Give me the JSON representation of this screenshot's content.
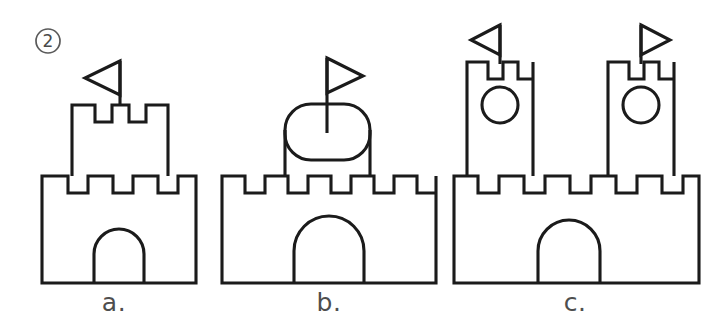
{
  "worksheet": {
    "item_number": "2",
    "item_number_marker": "circled-number",
    "background_color": "#ffffff",
    "ink_color": "#1b1b1b",
    "label_color": "#4e4e4e"
  },
  "options": [
    {
      "id": "a",
      "label": "a.",
      "description": "Castle with one square tower and one left-pointing flag",
      "tower_count": 1,
      "flag_count": 1,
      "flag_directions": [
        "left"
      ],
      "window_count": 0,
      "door_count": 1,
      "base_merlons": 3,
      "tower_shape": "square",
      "tower_merlons": 2
    },
    {
      "id": "b",
      "label": "b.",
      "description": "Castle with one rounded oval tower and one right-pointing flag",
      "tower_count": 1,
      "flag_count": 1,
      "flag_directions": [
        "right"
      ],
      "window_count": 0,
      "door_count": 1,
      "base_merlons": 5,
      "tower_shape": "rounded-stadium",
      "tower_merlons": 0
    },
    {
      "id": "c",
      "label": "c.",
      "description": "Castle with two tall towers, each with a round window and a flag",
      "tower_count": 2,
      "flag_count": 2,
      "flag_directions": [
        "left",
        "right"
      ],
      "window_count": 2,
      "door_count": 1,
      "base_merlons": 5,
      "tower_shape": "tall-rectangle",
      "tower_merlons": 2
    }
  ]
}
